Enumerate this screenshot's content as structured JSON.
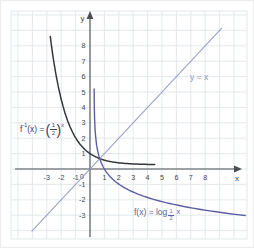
{
  "page": {
    "background": "#ffffff",
    "border_color": "#ececec"
  },
  "chart_data": {
    "type": "line",
    "xlabel": "x",
    "ylabel": "y",
    "origin_label": "0",
    "x_ticks": [
      -3,
      -2,
      -1,
      1,
      2,
      3,
      4,
      5,
      6,
      7,
      8
    ],
    "y_ticks": [
      8,
      7,
      6,
      5,
      4,
      3,
      2,
      1,
      -1,
      -2,
      -3
    ],
    "x_range": [
      -5.4,
      10.9
    ],
    "y_range": [
      -4.4,
      10.2
    ],
    "grid": true,
    "legend_position": "none",
    "axis_color": "#4b4e52",
    "grid_color": "#dce3e7",
    "tick_color": "#44474b",
    "series": [
      {
        "id": "f-inverse",
        "label": "f⁻¹(x) = (1/2)ˣ",
        "kind": "exponential",
        "base": 0.5,
        "color": "#34373c",
        "x_domain": [
          -2.76,
          4.56
        ],
        "key_points": [
          [
            -3,
            8
          ],
          [
            -2,
            4
          ],
          [
            -1,
            2
          ],
          [
            0,
            1
          ],
          [
            1,
            0.5
          ]
        ]
      },
      {
        "id": "identity-line",
        "label": "y = x",
        "kind": "line",
        "slope": 1,
        "intercept": 0,
        "color": "#9aa1c6",
        "x_domain": [
          -4.05,
          9.15
        ]
      },
      {
        "id": "f",
        "label": "f(x) = log₁∕₂ x",
        "kind": "logarithm",
        "base": 0.5,
        "color": "#5c5fa3",
        "y_domain": [
          5.2,
          -3.03
        ],
        "key_points": [
          [
            1,
            0
          ],
          [
            2,
            -1
          ],
          [
            4,
            -2
          ],
          [
            8,
            -3
          ]
        ]
      }
    ]
  },
  "labels": {
    "inverse": {
      "f": "f",
      "sup": "-1",
      "mid": "(x) =",
      "open": "(",
      "frac_num": "1",
      "frac_den": "2",
      "close": ")",
      "exp": "x"
    },
    "identity": {
      "text": "y = x"
    },
    "log": {
      "prefix": "f(x) = log",
      "sub_num": "1",
      "sub_den": "2",
      "arg": "x"
    }
  }
}
